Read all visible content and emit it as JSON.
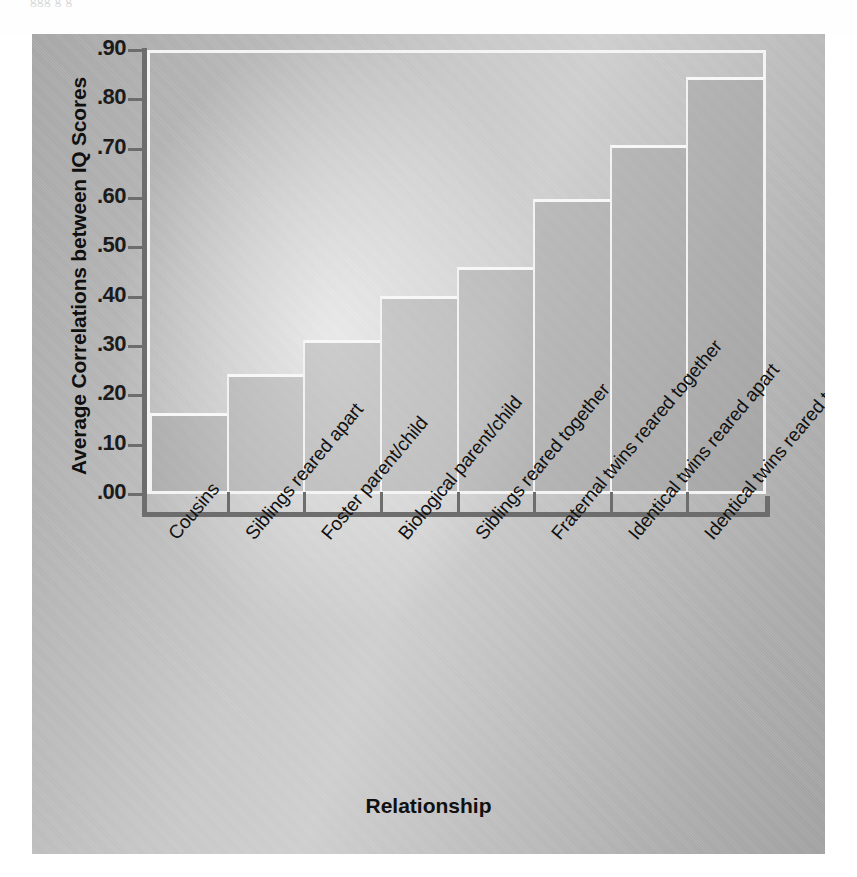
{
  "bleed_text": "ggg  g  g",
  "chart_data": {
    "type": "bar",
    "title": "",
    "xlabel": "Relationship",
    "ylabel": "Average Correlations between IQ Scores",
    "categories": [
      "Cousins",
      "Siblings reared apart",
      "Foster parent/child",
      "Biological parent/child",
      "Siblings reared together",
      "Fraternal twins reared together",
      "Identical twins reared apart",
      "Identical twins reared together"
    ],
    "values": [
      0.16,
      0.24,
      0.31,
      0.4,
      0.46,
      0.6,
      0.71,
      0.85
    ],
    "ylim": [
      0.0,
      0.9
    ],
    "ytick_labels": [
      ".90",
      ".80",
      ".70",
      ".60",
      ".50",
      ".40",
      ".30",
      ".20",
      ".10",
      ".00"
    ],
    "ytick_values": [
      0.9,
      0.8,
      0.7,
      0.6,
      0.5,
      0.4,
      0.3,
      0.2,
      0.1,
      0.0
    ],
    "grid": false,
    "legend": "none",
    "bar_fill_color": "#8c8c8c",
    "bar_outline_color": "#f4f4f4",
    "axis_color": "#6d6d6d",
    "text_color": "#111111",
    "background_color": "#bdbdbd"
  }
}
